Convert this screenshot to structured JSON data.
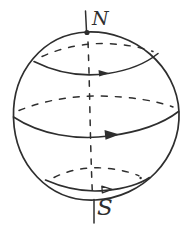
{
  "colors": {
    "ink": "#2e2e2e",
    "paper": "#ffffff"
  },
  "labels": {
    "north_pole": "N",
    "south_pole": "S"
  },
  "strokes": {
    "sphere_outline": "M 87 32 C 134 30 177 66 179 112 C 181 158 143 198 95 200 C 48 202 15 164 13.5 118 C 12 72 43 34 87 32",
    "north_axis": "M 85.5 11 L 86.5 31",
    "north_pole_dot": "M 84.4 32.5 a 2.6 2.6 0 1 0 5.2 0 a 2.6 2.6 0 1 0 -5.2 0 Z",
    "south_axis": "M 94 199.5 L 94 223",
    "rotation_axis": "M 88 42 C 90 92 90 142 92.5 196",
    "lat_top_back": "M 42 56.5 C 64 46.5 86 43.5 103 43.5 C 125 44 142 47.5 153 51.5",
    "lat_top_front": "M 34 61.5 C 58 73.5 84 77 108 73.5 C 131 70 147 62.5 158 53.5",
    "arrow_top": "M 109.5 73.2 L 98.5 70.1 L 99.2 76.5 Z",
    "equator_back": "M 19 110.5 C 45 100 72 96 99 96 C 129 96.5 156 100.5 173 107",
    "equator_front": "M 13.5 117 C 40 134.5 76 140.5 109 136 C 139 132 163 123.5 178.5 111.5",
    "arrow_equator": "M 119.5 134.6 L 104.5 130 L 105.5 139.8 Z",
    "lat_bottom_back": "M 54 177.5 C 70 169.5 86 167.5 98 167.8 C 113 168 129 171.5 139 175.8",
    "lat_bottom_front": "M 45.5 180 C 66 189 88 192.3 106 190.4 C 124 188.6 140 184 149.5 177.5",
    "arrow_bottom": "M 112 189.4 L 101.8 186.1 L 102.4 192.9 Z",
    "ink_speck": "M 139.4 178 a 1.2 1.2 0 1 0 2.4 0 a 1.2 1.2 0 1 0 -2.4 0 Z"
  }
}
